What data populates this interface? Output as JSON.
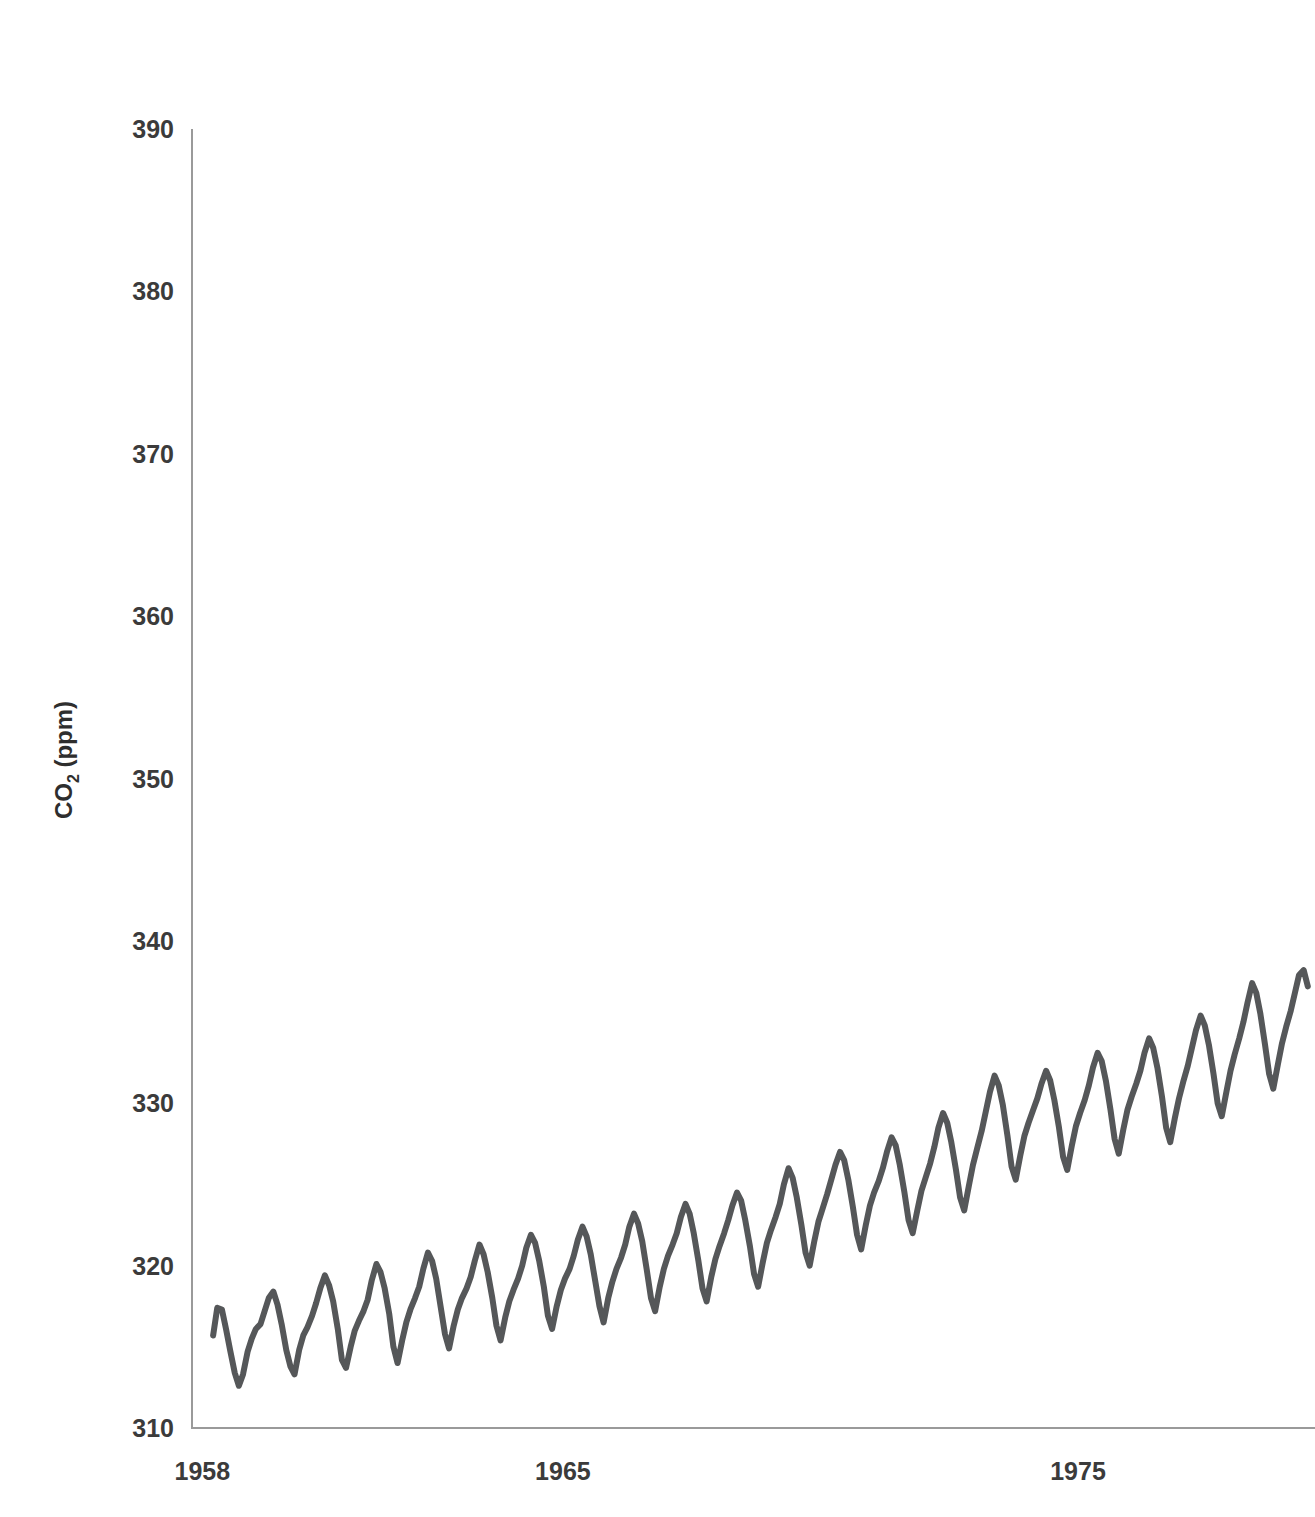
{
  "figure": {
    "background_color": "#ffffff",
    "axis_color": "#9a9a9a",
    "text_color": "#3b3b3b",
    "line_color": "#555759",
    "line_width": 6
  },
  "axes": {
    "ylabel_main": "CO",
    "ylabel_subscript": "2",
    "ylabel_units": " (ppm)",
    "ylabel_full": "CO2 (ppm)",
    "y_ticks": [
      310,
      320,
      330,
      340,
      350,
      360,
      370,
      380,
      390
    ],
    "y_tick_labels": [
      "310",
      "320",
      "330",
      "340",
      "350",
      "360",
      "370",
      "380",
      "390"
    ],
    "x_ticks": [
      1958,
      1965,
      1975
    ],
    "x_tick_labels": [
      "1958",
      "1965",
      "1975"
    ],
    "ylim": [
      310,
      390
    ],
    "xlim": [
      1957.8,
      1979.6
    ],
    "grid": false,
    "legend": "none"
  },
  "chart_data": {
    "type": "line",
    "title": "",
    "xlabel": "",
    "ylabel": "CO2 (ppm)",
    "ylim": [
      310,
      390
    ],
    "xlim": [
      1957.8,
      1979.6
    ],
    "grid": false,
    "legend_position": "none",
    "series": [
      {
        "name": "Mauna Loa monthly mean CO2",
        "color": "#555759",
        "x": [
          1958.21,
          1958.29,
          1958.38,
          1958.46,
          1958.54,
          1958.63,
          1958.71,
          1958.79,
          1958.88,
          1958.96,
          1959.04,
          1959.13,
          1959.21,
          1959.29,
          1959.38,
          1959.46,
          1959.54,
          1959.63,
          1959.71,
          1959.79,
          1959.88,
          1959.96,
          1960.04,
          1960.13,
          1960.21,
          1960.29,
          1960.38,
          1960.46,
          1960.54,
          1960.63,
          1960.71,
          1960.79,
          1960.88,
          1960.96,
          1961.04,
          1961.13,
          1961.21,
          1961.29,
          1961.38,
          1961.46,
          1961.54,
          1961.63,
          1961.71,
          1961.79,
          1961.88,
          1961.96,
          1962.04,
          1962.13,
          1962.21,
          1962.29,
          1962.38,
          1962.46,
          1962.54,
          1962.63,
          1962.71,
          1962.79,
          1962.88,
          1962.96,
          1963.04,
          1963.13,
          1963.21,
          1963.29,
          1963.38,
          1963.46,
          1963.54,
          1963.63,
          1963.71,
          1963.79,
          1963.88,
          1963.96,
          1964.04,
          1964.13,
          1964.21,
          1964.29,
          1964.38,
          1964.46,
          1964.54,
          1964.63,
          1964.71,
          1964.79,
          1964.88,
          1964.96,
          1965.04,
          1965.13,
          1965.21,
          1965.29,
          1965.38,
          1965.46,
          1965.54,
          1965.63,
          1965.71,
          1965.79,
          1965.88,
          1965.96,
          1966.04,
          1966.13,
          1966.21,
          1966.29,
          1966.38,
          1966.46,
          1966.54,
          1966.63,
          1966.71,
          1966.79,
          1966.88,
          1966.96,
          1967.04,
          1967.13,
          1967.21,
          1967.29,
          1967.38,
          1967.46,
          1967.54,
          1967.63,
          1967.71,
          1967.79,
          1967.88,
          1967.96,
          1968.04,
          1968.13,
          1968.21,
          1968.29,
          1968.38,
          1968.46,
          1968.54,
          1968.63,
          1968.71,
          1968.79,
          1968.88,
          1968.96,
          1969.04,
          1969.13,
          1969.21,
          1969.29,
          1969.38,
          1969.46,
          1969.54,
          1969.63,
          1969.71,
          1969.79,
          1969.88,
          1969.96,
          1970.04,
          1970.13,
          1970.21,
          1970.29,
          1970.38,
          1970.46,
          1970.54,
          1970.63,
          1970.71,
          1970.79,
          1970.88,
          1970.96,
          1971.04,
          1971.13,
          1971.21,
          1971.29,
          1971.38,
          1971.46,
          1971.54,
          1971.63,
          1971.71,
          1971.79,
          1971.88,
          1971.96,
          1972.04,
          1972.13,
          1972.21,
          1972.29,
          1972.38,
          1972.46,
          1972.54,
          1972.63,
          1972.71,
          1972.79,
          1972.88,
          1972.96,
          1973.04,
          1973.13,
          1973.21,
          1973.29,
          1973.38,
          1973.46,
          1973.54,
          1973.63,
          1973.71,
          1973.79,
          1973.88,
          1973.96,
          1974.04,
          1974.13,
          1974.21,
          1974.29,
          1974.38,
          1974.46,
          1974.54,
          1974.63,
          1974.71,
          1974.79,
          1974.88,
          1974.96,
          1975.04,
          1975.13,
          1975.21,
          1975.29,
          1975.38,
          1975.46,
          1975.54,
          1975.63,
          1975.71,
          1975.79,
          1975.88,
          1975.96,
          1976.04,
          1976.13,
          1976.21,
          1976.29,
          1976.38,
          1976.46,
          1976.54,
          1976.63,
          1976.71,
          1976.79,
          1976.88,
          1976.96,
          1977.04,
          1977.13,
          1977.21,
          1977.29,
          1977.38,
          1977.46,
          1977.54,
          1977.63,
          1977.71,
          1977.79,
          1977.88,
          1977.96,
          1978.04,
          1978.13,
          1978.21,
          1978.29,
          1978.38,
          1978.46,
          1978.54,
          1978.63,
          1978.71,
          1978.79,
          1978.88,
          1978.96,
          1979.04,
          1979.13,
          1979.21,
          1979.29,
          1979.38,
          1979.46
        ],
        "y": [
          315.7,
          317.4,
          317.3,
          316.1,
          314.8,
          313.4,
          312.6,
          313.3,
          314.7,
          315.5,
          316.1,
          316.4,
          317.2,
          318.0,
          318.4,
          317.6,
          316.4,
          314.8,
          313.8,
          313.3,
          314.8,
          315.7,
          316.2,
          316.9,
          317.7,
          318.6,
          319.4,
          318.8,
          317.8,
          316.1,
          314.2,
          313.7,
          315.0,
          316.0,
          316.6,
          317.2,
          317.9,
          319.1,
          320.1,
          319.6,
          318.6,
          317.0,
          315.0,
          314.0,
          315.4,
          316.5,
          317.3,
          318.0,
          318.7,
          319.8,
          320.8,
          320.3,
          319.2,
          317.4,
          315.8,
          314.9,
          316.3,
          317.3,
          318.0,
          318.6,
          319.3,
          320.3,
          321.3,
          320.7,
          319.6,
          318.0,
          316.3,
          315.4,
          316.8,
          317.8,
          318.5,
          319.2,
          320.0,
          321.1,
          321.9,
          321.4,
          320.3,
          318.7,
          316.9,
          316.1,
          317.5,
          318.5,
          319.2,
          319.8,
          320.6,
          321.6,
          322.4,
          321.8,
          320.7,
          319.0,
          317.5,
          316.5,
          318.0,
          319.0,
          319.8,
          320.5,
          321.3,
          322.4,
          323.2,
          322.6,
          321.5,
          319.7,
          318.0,
          317.2,
          318.7,
          319.8,
          320.6,
          321.3,
          322.0,
          323.0,
          323.8,
          323.2,
          322.0,
          320.3,
          318.6,
          317.8,
          319.3,
          320.4,
          321.2,
          322.0,
          322.8,
          323.7,
          324.5,
          324.0,
          322.8,
          321.2,
          319.5,
          318.7,
          320.2,
          321.4,
          322.2,
          323.0,
          323.8,
          325.0,
          326.0,
          325.4,
          324.2,
          322.5,
          320.8,
          320.0,
          321.5,
          322.7,
          323.5,
          324.4,
          325.3,
          326.2,
          327.0,
          326.5,
          325.3,
          323.6,
          321.9,
          321.0,
          322.5,
          323.7,
          324.5,
          325.2,
          326.0,
          327.0,
          327.9,
          327.4,
          326.2,
          324.5,
          322.8,
          322.0,
          323.4,
          324.6,
          325.4,
          326.3,
          327.3,
          328.5,
          329.4,
          328.8,
          327.6,
          325.9,
          324.2,
          323.4,
          324.9,
          326.2,
          327.2,
          328.3,
          329.5,
          330.7,
          331.7,
          331.1,
          329.9,
          328.0,
          326.1,
          325.3,
          326.8,
          328.0,
          328.8,
          329.6,
          330.3,
          331.2,
          332.0,
          331.4,
          330.2,
          328.5,
          326.7,
          325.9,
          327.4,
          328.6,
          329.4,
          330.2,
          331.1,
          332.2,
          333.1,
          332.6,
          331.4,
          329.6,
          327.8,
          326.9,
          328.4,
          329.6,
          330.4,
          331.2,
          332.0,
          333.1,
          334.0,
          333.4,
          332.2,
          330.4,
          328.5,
          327.6,
          329.1,
          330.3,
          331.3,
          332.3,
          333.4,
          334.5,
          335.4,
          334.8,
          333.6,
          331.8,
          330.0,
          329.2,
          330.7,
          332.0,
          333.0,
          334.0,
          335.0,
          336.2,
          337.4,
          336.8,
          335.5,
          333.6,
          331.8,
          330.9,
          332.4,
          333.7,
          334.7,
          335.7,
          336.8,
          337.9,
          338.2,
          337.2
        ]
      }
    ]
  }
}
